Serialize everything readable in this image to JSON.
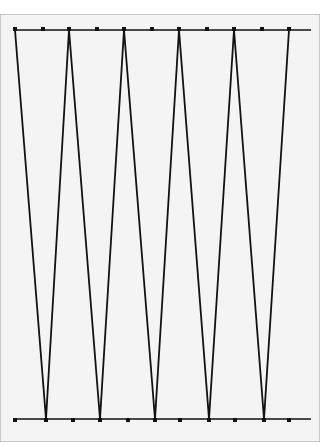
{
  "diagram": {
    "type": "zigzag-truss",
    "colors": {
      "background": "#ffffff",
      "panel": "#f4f4f4",
      "panel_border": "#c8c8c8",
      "line": "#111111"
    },
    "top_chord": {
      "y": 30,
      "x1": 13,
      "x2": 311
    },
    "bottom_chord": {
      "y": 419,
      "x1": 13,
      "x2": 311
    },
    "zigzag_points": [
      [
        15,
        30
      ],
      [
        46,
        419
      ],
      [
        69,
        30
      ],
      [
        100,
        419
      ],
      [
        124,
        30
      ],
      [
        155,
        419
      ],
      [
        179,
        30
      ],
      [
        209,
        419
      ],
      [
        234,
        30
      ],
      [
        264,
        419
      ],
      [
        289,
        30
      ]
    ],
    "top_nodes_x": [
      15,
      43,
      69,
      97,
      124,
      152,
      179,
      207,
      234,
      262,
      289
    ],
    "bottom_nodes_x": [
      15,
      46,
      73,
      100,
      128,
      155,
      180,
      209,
      235,
      264,
      289
    ]
  }
}
